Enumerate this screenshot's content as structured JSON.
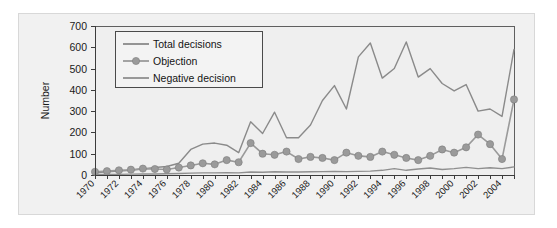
{
  "chart_data": {
    "type": "line",
    "title": "",
    "xlabel": "",
    "ylabel": "Number",
    "ylim": [
      0,
      700
    ],
    "ytick_step": 100,
    "yticks": [
      0,
      100,
      200,
      300,
      400,
      500,
      600,
      700
    ],
    "xlim": [
      1970,
      2005
    ],
    "grid": true,
    "legend_position": "top-left inside plot",
    "x": [
      1970,
      1971,
      1972,
      1973,
      1974,
      1975,
      1976,
      1977,
      1978,
      1979,
      1980,
      1981,
      1982,
      1983,
      1984,
      1985,
      1986,
      1987,
      1988,
      1989,
      1990,
      1991,
      1992,
      1993,
      1994,
      1995,
      1996,
      1997,
      1998,
      1999,
      2000,
      2001,
      2002,
      2003,
      2004,
      2005
    ],
    "xtick_labels": [
      "1970",
      "1972",
      "1974",
      "1976",
      "1978",
      "1980",
      "1982",
      "1984",
      "1986",
      "1988",
      "1990",
      "1992",
      "1994",
      "1996",
      "1998",
      "2000",
      "2002",
      "2004"
    ],
    "series": [
      {
        "name": "Total decisions",
        "color": "#8a8a8a",
        "marker": "none",
        "values": [
          10,
          15,
          18,
          22,
          28,
          35,
          40,
          55,
          120,
          145,
          150,
          140,
          105,
          250,
          195,
          295,
          175,
          175,
          235,
          350,
          420,
          310,
          555,
          620,
          455,
          500,
          625,
          460,
          500,
          430,
          395,
          425,
          300,
          310,
          275,
          590
        ]
      },
      {
        "name": "Objection",
        "color": "#9a9a9a",
        "marker": "circle",
        "values": [
          15,
          18,
          22,
          25,
          30,
          28,
          26,
          35,
          45,
          55,
          50,
          70,
          60,
          150,
          100,
          95,
          110,
          75,
          85,
          80,
          70,
          105,
          90,
          85,
          110,
          95,
          80,
          70,
          90,
          120,
          105,
          130,
          190,
          145,
          75,
          355
        ]
      },
      {
        "name": "Negative decision",
        "color": "#8f8f8f",
        "marker": "none",
        "values": [
          2,
          3,
          3,
          4,
          5,
          5,
          6,
          7,
          9,
          10,
          10,
          11,
          10,
          14,
          13,
          15,
          14,
          14,
          15,
          16,
          17,
          16,
          17,
          18,
          22,
          30,
          22,
          28,
          33,
          26,
          30,
          36,
          30,
          34,
          30,
          38
        ]
      }
    ]
  },
  "axis": {
    "ylabel": "Number"
  },
  "legend": {
    "items": [
      {
        "label": "Total decisions"
      },
      {
        "label": "Objection"
      },
      {
        "label": "Negative decision"
      }
    ]
  }
}
